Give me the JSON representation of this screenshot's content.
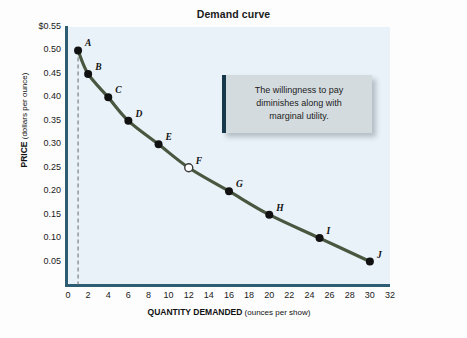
{
  "chart_data": {
    "type": "line",
    "title": "Demand curve",
    "xlabel_bold": "QUANTITY DEMANDED",
    "xlabel_rest": "(ounces per show)",
    "ylabel_bold": "PRICE",
    "ylabel_rest": "(dollars per ounce)",
    "xlim": [
      0,
      32
    ],
    "ylim": [
      0,
      0.55
    ],
    "grid": false,
    "legend": "none",
    "x_ticks": [
      "0",
      "2",
      "4",
      "6",
      "8",
      "10",
      "12",
      "14",
      "16",
      "18",
      "20",
      "22",
      "24",
      "26",
      "28",
      "30",
      "32"
    ],
    "x_tick_values": [
      0,
      2,
      4,
      6,
      8,
      10,
      12,
      14,
      16,
      18,
      20,
      22,
      24,
      26,
      28,
      30,
      32
    ],
    "y_ticks": [
      "$0.55",
      "0.50",
      "0.45",
      "0.40",
      "0.35",
      "0.30",
      "0.25",
      "0.20",
      "0.15",
      "0.10",
      "0.05"
    ],
    "y_tick_values": [
      0.55,
      0.5,
      0.45,
      0.4,
      0.35,
      0.3,
      0.25,
      0.2,
      0.15,
      0.1,
      0.05
    ],
    "series": [
      {
        "name": "Demand",
        "color": "#4a5740",
        "points": [
          {
            "label": "A",
            "x": 1,
            "y": 0.5,
            "filled": true,
            "label_dx": 7,
            "label_dy": -11
          },
          {
            "label": "B",
            "x": 2,
            "y": 0.45,
            "filled": true,
            "label_dx": 7,
            "label_dy": -11
          },
          {
            "label": "C",
            "x": 4,
            "y": 0.4,
            "filled": true,
            "label_dx": 7,
            "label_dy": -11
          },
          {
            "label": "D",
            "x": 6,
            "y": 0.35,
            "filled": true,
            "label_dx": 7,
            "label_dy": -11
          },
          {
            "label": "E",
            "x": 9,
            "y": 0.3,
            "filled": true,
            "label_dx": 7,
            "label_dy": -11
          },
          {
            "label": "F",
            "x": 12,
            "y": 0.25,
            "filled": false,
            "label_dx": 7,
            "label_dy": -11
          },
          {
            "label": "G",
            "x": 16,
            "y": 0.2,
            "filled": true,
            "label_dx": 7,
            "label_dy": -11
          },
          {
            "label": "H",
            "x": 20,
            "y": 0.15,
            "filled": true,
            "label_dx": 7,
            "label_dy": -11
          },
          {
            "label": "I",
            "x": 25,
            "y": 0.1,
            "filled": true,
            "label_dx": 7,
            "label_dy": -11
          },
          {
            "label": "J",
            "x": 30,
            "y": 0.05,
            "filled": true,
            "label_dx": 7,
            "label_dy": -11
          }
        ]
      }
    ],
    "reference_line": {
      "type": "vertical-dashed",
      "x": 1,
      "color": "#6a6a6a"
    },
    "annotation": {
      "line1": "The willingness to pay",
      "line2": "diminishes along with",
      "line3": "marginal utility."
    }
  },
  "colors": {
    "curve": "#4a5740",
    "axis": "#2d5c73",
    "plot_background": "#e9f2f8",
    "callout_fill": "#d4dbdf",
    "callout_border": "#17384a",
    "marker": "#111111"
  },
  "bleed_text": {
    "lines": [
      "the marginal utility of each additional ounce of popcorn",
      "consumer will be willing to pay for the next one. At we introduced",
      "the idea that marginal utility declines as consumption increases",
      "the same as the price for each ounce. Taken together the demand",
      "interest in the good and the willingness to pay and the quantity",
      "the quantity the consumer is willing to buy at each possible price",
      "more ounces - pay less, resulting in a downward sloping demand"
    ]
  }
}
